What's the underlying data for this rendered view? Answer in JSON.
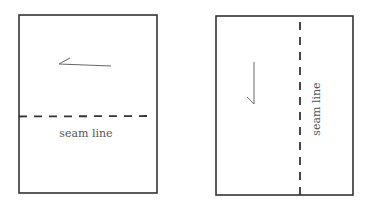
{
  "diagram": {
    "colors": {
      "stroke": "#333333",
      "mark": "#555555",
      "text": "#555555",
      "background": "#ffffff"
    },
    "panels": [
      {
        "id": "left",
        "orientation": "horizontal-seam",
        "seam_label": "seam line"
      },
      {
        "id": "right",
        "orientation": "vertical-seam",
        "seam_label": "seam line"
      }
    ]
  }
}
